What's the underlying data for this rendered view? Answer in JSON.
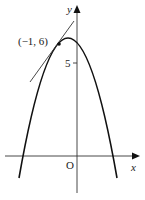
{
  "diagram": {
    "type": "function-graph",
    "curve": {
      "name": "parabola",
      "equation": "y = -x^2 - x + 6",
      "x_intercepts": [
        -3,
        2
      ]
    },
    "tangent_line": {
      "at_point": [
        -1,
        6
      ],
      "equation": "y = x + 7"
    },
    "labels": {
      "x_axis": "x",
      "y_axis": "y",
      "origin": "O",
      "y_tick": "5",
      "point": "(−1, 6)"
    },
    "colors": {
      "ink": "#222222",
      "background": "#ffffff"
    }
  }
}
